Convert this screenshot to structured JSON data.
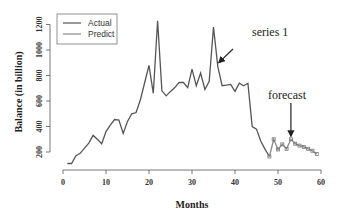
{
  "chart_data": {
    "type": "line",
    "title": "",
    "xlabel": "Months",
    "ylabel": "Balance (in billion)",
    "xlim": [
      0,
      60
    ],
    "ylim": [
      100,
      1250
    ],
    "xticks": [
      0,
      10,
      20,
      30,
      40,
      50,
      60
    ],
    "yticks": [
      200,
      400,
      600,
      800,
      1000,
      1200
    ],
    "grid": false,
    "legend_position": "top-left",
    "series": [
      {
        "name": "Actual",
        "color": "#555555",
        "x": [
          1,
          2,
          3,
          4,
          5,
          6,
          7,
          8,
          9,
          10,
          11,
          12,
          13,
          14,
          15,
          16,
          17,
          18,
          19,
          20,
          21,
          22,
          23,
          24,
          25,
          26,
          27,
          28,
          29,
          30,
          31,
          32,
          33,
          34,
          35,
          36,
          37,
          38,
          39,
          40,
          41,
          42,
          43,
          44,
          45,
          46,
          47,
          48
        ],
        "values": [
          110,
          110,
          170,
          190,
          230,
          270,
          330,
          300,
          265,
          360,
          410,
          455,
          450,
          345,
          440,
          500,
          510,
          610,
          745,
          880,
          660,
          1230,
          680,
          640,
          675,
          705,
          745,
          745,
          705,
          850,
          720,
          820,
          690,
          755,
          1180,
          870,
          720,
          725,
          730,
          675,
          740,
          720,
          740,
          400,
          380,
          285,
          220,
          165
        ]
      },
      {
        "name": "Predict",
        "color": "#888888",
        "x": [
          48,
          49,
          50,
          51,
          52,
          53,
          54,
          55,
          56,
          57,
          58,
          59
        ],
        "values": [
          165,
          300,
          220,
          260,
          225,
          300,
          265,
          250,
          240,
          225,
          210,
          185
        ]
      }
    ],
    "annotations": [
      {
        "text": "series 1",
        "points_to": {
          "x": 36,
          "y": 870
        }
      },
      {
        "text": "forecast",
        "points_to": {
          "x": 53,
          "y": 300
        }
      }
    ]
  }
}
